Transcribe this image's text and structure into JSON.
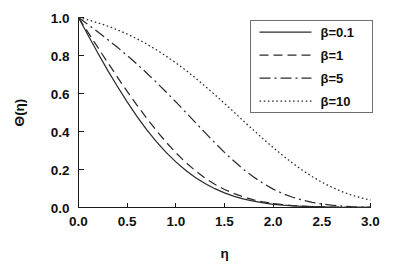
{
  "chart_data": {
    "type": "line",
    "title": "",
    "xlabel": "η",
    "ylabel": "Θ(η)",
    "xlim": [
      0.0,
      3.0
    ],
    "ylim": [
      0.0,
      1.0
    ],
    "grid": false,
    "legend_position": "top-right",
    "xticks": [
      "0.0",
      "0.5",
      "1.0",
      "1.5",
      "2.0",
      "2.5",
      "3.0"
    ],
    "xtick_values": [
      0.0,
      0.5,
      1.0,
      1.5,
      2.0,
      2.5,
      3.0
    ],
    "yticks": [
      "0.0",
      "0.2",
      "0.4",
      "0.6",
      "0.8",
      "1.0"
    ],
    "ytick_values": [
      0.0,
      0.2,
      0.4,
      0.6,
      0.8,
      1.0
    ],
    "x": [
      0.0,
      0.1,
      0.2,
      0.3,
      0.4,
      0.5,
      0.6,
      0.7,
      0.8,
      0.9,
      1.0,
      1.1,
      1.2,
      1.3,
      1.4,
      1.5,
      1.6,
      1.7,
      1.8,
      1.9,
      2.0,
      2.1,
      2.2,
      2.3,
      2.4,
      2.5,
      2.6,
      2.7,
      2.8,
      2.9,
      3.0
    ],
    "series": [
      {
        "name": "β=0.1",
        "linestyle": "solid",
        "dasharray": "",
        "color": "#2b2b2b",
        "values": [
          1.0,
          0.905,
          0.812,
          0.722,
          0.637,
          0.556,
          0.48,
          0.41,
          0.347,
          0.29,
          0.24,
          0.196,
          0.158,
          0.126,
          0.099,
          0.077,
          0.059,
          0.044,
          0.033,
          0.024,
          0.017,
          0.012,
          0.0085,
          0.006,
          0.004,
          0.0027,
          0.0018,
          0.0012,
          0.0008,
          0.0005,
          0.0003
        ]
      },
      {
        "name": "β=1",
        "linestyle": "dashed",
        "dasharray": "9,5",
        "color": "#2b2b2b",
        "values": [
          1.0,
          0.92,
          0.841,
          0.763,
          0.686,
          0.611,
          0.539,
          0.47,
          0.405,
          0.344,
          0.288,
          0.238,
          0.194,
          0.155,
          0.122,
          0.095,
          0.073,
          0.055,
          0.04,
          0.029,
          0.021,
          0.015,
          0.0104,
          0.0072,
          0.0049,
          0.0033,
          0.0022,
          0.0014,
          0.0009,
          0.0006,
          0.0004
        ]
      },
      {
        "name": "β=5",
        "linestyle": "dashdot",
        "dasharray": "11,4,2,4",
        "color": "#2b2b2b",
        "values": [
          1.0,
          0.962,
          0.924,
          0.884,
          0.843,
          0.8,
          0.755,
          0.708,
          0.659,
          0.608,
          0.556,
          0.502,
          0.448,
          0.394,
          0.341,
          0.29,
          0.243,
          0.199,
          0.16,
          0.126,
          0.097,
          0.073,
          0.054,
          0.039,
          0.027,
          0.018,
          0.012,
          0.0075,
          0.0045,
          0.0026,
          0.0014
        ]
      },
      {
        "name": "β=10",
        "linestyle": "dotted",
        "dasharray": "1.6,2.6",
        "color": "#2b2b2b",
        "values": [
          1.0,
          0.987,
          0.972,
          0.955,
          0.935,
          0.913,
          0.888,
          0.861,
          0.83,
          0.797,
          0.761,
          0.723,
          0.682,
          0.639,
          0.594,
          0.548,
          0.501,
          0.453,
          0.406,
          0.36,
          0.316,
          0.273,
          0.233,
          0.196,
          0.163,
          0.133,
          0.107,
          0.085,
          0.066,
          0.051,
          0.039
        ]
      }
    ]
  },
  "legend": {
    "entries": [
      {
        "label": "β=0.1"
      },
      {
        "label": "β=1"
      },
      {
        "label": "β=5"
      },
      {
        "label": "β=10"
      }
    ]
  }
}
